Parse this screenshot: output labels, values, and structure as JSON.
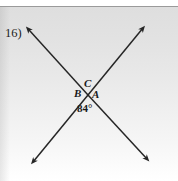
{
  "figure": {
    "problem_number": "16)",
    "vertex_labels": {
      "a": "A",
      "b": "B",
      "c": "C"
    },
    "angle_measure": "84°",
    "colors": {
      "line": "#262626",
      "text": "#1a1a1a",
      "rule": "#9a9a9a",
      "page_top": "#dedede",
      "page_bottom": "#ffffff"
    },
    "geometry": {
      "intersection": {
        "x": 88,
        "y": 95
      },
      "line_1": {
        "name": "line-nw-se",
        "from": {
          "x": 27,
          "y": 28
        },
        "to": {
          "x": 148,
          "y": 160
        }
      },
      "line_2": {
        "name": "line-sw-ne",
        "from": {
          "x": 32,
          "y": 163
        },
        "to": {
          "x": 144,
          "y": 27
        }
      },
      "arrow_tips": [
        {
          "name": "arrow-top-left",
          "x": 27,
          "y": 28
        },
        {
          "name": "arrow-top-right",
          "x": 144,
          "y": 27
        },
        {
          "name": "arrow-bottom-left",
          "x": 32,
          "y": 163
        },
        {
          "name": "arrow-bottom-right",
          "x": 148,
          "y": 160
        }
      ]
    }
  }
}
